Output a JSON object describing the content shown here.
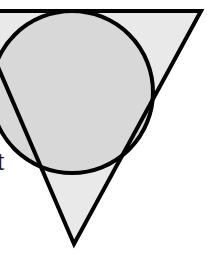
{
  "figure": {
    "name": "inverted-triangle-with-inscribed-circle",
    "canvas": {
      "width": 207,
      "height": 267,
      "background": "#ffffff"
    },
    "colors": {
      "stroke": "#000000",
      "circle_fill": "#d8d8d8",
      "triangle_fill": "#e9e9e9",
      "label_color": "#1a1a1a",
      "background": "#ffffff"
    },
    "stroke_width": 4,
    "triangle": {
      "label": "inverted triangle",
      "vertices": [
        {
          "name": "top-left",
          "x": -26,
          "y": 11
        },
        {
          "name": "top-right",
          "x": 201,
          "y": 11
        },
        {
          "name": "bottom-apex",
          "x": 74,
          "y": 244
        }
      ],
      "points_attr": "-26,11 201,11 74,244"
    },
    "circle": {
      "label": "inscribed circle",
      "center": {
        "x": 72,
        "y": 92
      },
      "radius": 81,
      "tangent_points": [
        {
          "name": "tangent-top",
          "x": 76,
          "y": 11
        },
        {
          "name": "tangent-right",
          "x": 147,
          "y": 105
        }
      ]
    },
    "labels": [
      {
        "name": "cut-off-label",
        "text": "t",
        "x": 0,
        "y": 152,
        "note": "partially cropped at left edge"
      }
    ]
  }
}
